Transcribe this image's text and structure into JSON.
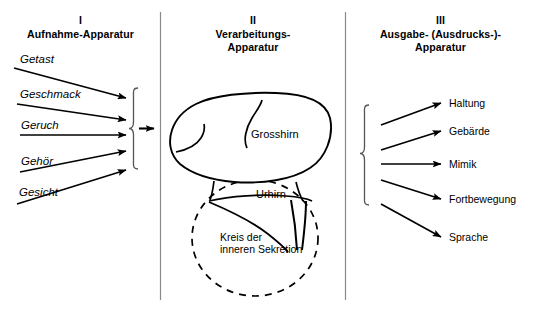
{
  "diagram": {
    "title_semantic": "three-stage-model-of-perception-processing-expression",
    "background_color": "#ffffff",
    "stroke_color": "#000000",
    "divider_color": "#888888"
  },
  "columns": [
    {
      "numeral": "I",
      "name": "Aufnahme-Apparatur"
    },
    {
      "numeral": "II",
      "name_line1": "Verarbeitungs-",
      "name_line2": "Apparatur"
    },
    {
      "numeral": "III",
      "name_line1": "Ausgabe- (Ausdrucks-)-",
      "name_line2": "Apparatur"
    }
  ],
  "inputs": [
    {
      "label": "Getast"
    },
    {
      "label": "Geschmack"
    },
    {
      "label": "Geruch"
    },
    {
      "label": "Gehör"
    },
    {
      "label": "Gesicht"
    }
  ],
  "brain": {
    "cerebrum_label": "Grosshirn",
    "brainstem_label": "Urhirn",
    "secretion_label_line1": "Kreis der",
    "secretion_label_line2": "inneren Sekretion"
  },
  "outputs": [
    {
      "label": "Haltung"
    },
    {
      "label": "Gebärde"
    },
    {
      "label": "Mimik"
    },
    {
      "label": "Fortbewegung"
    },
    {
      "label": "Sprache"
    }
  ]
}
